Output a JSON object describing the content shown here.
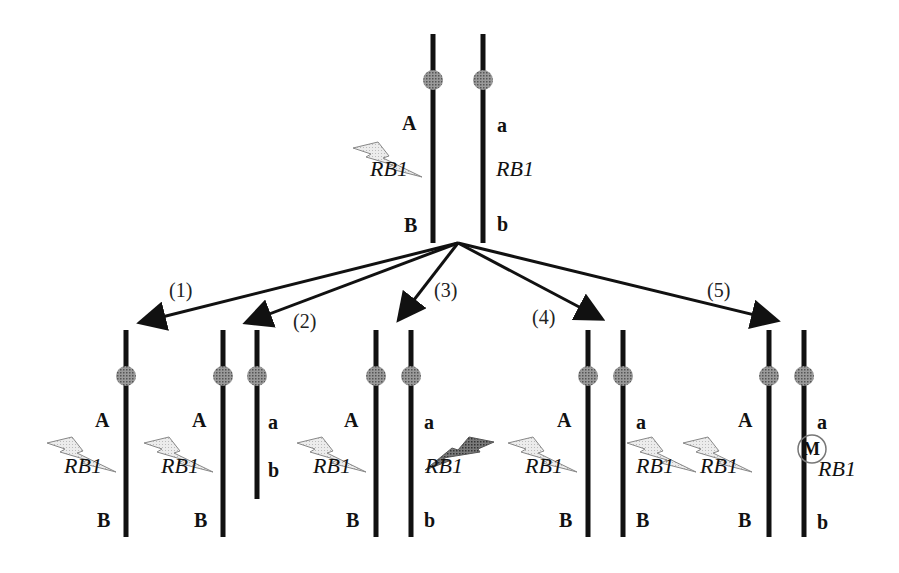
{
  "figure": {
    "parent": {
      "left_chromosome": {
        "top": "A",
        "gene": "RB1",
        "bottom": "B",
        "hit": "germline-mutation"
      },
      "right_chromosome": {
        "top": "a",
        "gene": "RB1",
        "bottom": "b",
        "hit": "none"
      }
    },
    "pathways": [
      {
        "label": "(1)",
        "left": {
          "top": "A",
          "gene": "RB1",
          "bottom": "B",
          "hit": "germline"
        },
        "right": null
      },
      {
        "label": "(2)",
        "left": {
          "top": "A",
          "gene": "RB1",
          "bottom": "B",
          "hit": "germline"
        },
        "right": {
          "top": "a",
          "gene": "",
          "bottom": "b",
          "hit": "deletion"
        }
      },
      {
        "label": "(3)",
        "left": {
          "top": "A",
          "gene": "RB1",
          "bottom": "B",
          "hit": "germline"
        },
        "right": {
          "top": "a",
          "gene": "RB1",
          "bottom": "b",
          "hit": "somatic-mutation"
        }
      },
      {
        "label": "(4)",
        "left": {
          "top": "A",
          "gene": "RB1",
          "bottom": "B",
          "hit": "germline"
        },
        "right": {
          "top": "a",
          "gene": "RB1",
          "bottom": "B",
          "hit": "germline"
        }
      },
      {
        "label": "(5)",
        "left": {
          "top": "A",
          "gene": "RB1",
          "bottom": "B",
          "hit": "germline"
        },
        "right": {
          "top": "a",
          "gene": "RB1",
          "bottom": "b",
          "hit": "methylation",
          "marker": "M"
        }
      }
    ],
    "colors": {
      "line": "#111111",
      "centromere": "#8a8a8a",
      "bolt_light": "#e4e4e4",
      "bolt_dark": "#6e6e6e"
    }
  }
}
